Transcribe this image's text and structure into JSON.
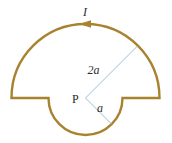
{
  "figure": {
    "colors": {
      "wire": "#a8822e",
      "radius_line": "#8fb8c6",
      "text": "#2b2b2b",
      "background": "#ffffff"
    },
    "geometry": {
      "center": [
        85.5,
        98
      ],
      "large_radius": 74,
      "small_radius": 37,
      "current_direction": "counterclockwise (arrow pointing left at top of large arc)"
    },
    "labels": {
      "current": "I",
      "point": "P",
      "large_radius": "2a",
      "small_radius": "a"
    }
  }
}
